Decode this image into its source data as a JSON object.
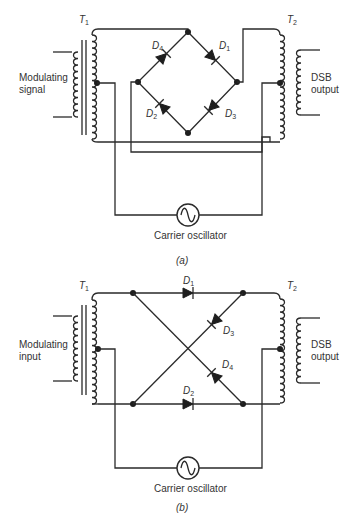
{
  "diagrams": [
    {
      "id": "a",
      "caption": "(a)",
      "transformer_left": {
        "name": "T",
        "sub": "1"
      },
      "transformer_right": {
        "name": "T",
        "sub": "2"
      },
      "input_label_line1": "Modulating",
      "input_label_line2": "signal",
      "output_label_line1": "DSB",
      "output_label_line2": "output",
      "oscillator_label": "Carrier oscillator",
      "diodes": [
        {
          "name": "D",
          "sub": "4"
        },
        {
          "name": "D",
          "sub": "1"
        },
        {
          "name": "D",
          "sub": "2"
        },
        {
          "name": "D",
          "sub": "3"
        }
      ]
    },
    {
      "id": "b",
      "caption": "(b)",
      "transformer_left": {
        "name": "T",
        "sub": "1"
      },
      "transformer_right": {
        "name": "T",
        "sub": "2"
      },
      "input_label_line1": "Modulating",
      "input_label_line2": "input",
      "output_label_line1": "DSB",
      "output_label_line2": "output",
      "oscillator_label": "Carrier oscillator",
      "diodes": [
        {
          "name": "D",
          "sub": "1"
        },
        {
          "name": "D",
          "sub": "3"
        },
        {
          "name": "D",
          "sub": "4"
        },
        {
          "name": "D",
          "sub": "2"
        }
      ]
    }
  ]
}
